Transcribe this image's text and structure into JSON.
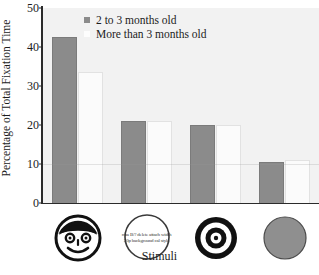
{
  "chart_data": {
    "type": "bar",
    "title": "",
    "xlabel": "Stimuli",
    "ylabel": "Percentage of Total Fixation Time",
    "categories": [
      "face",
      "scrambled-face",
      "bullseye",
      "blank-gray-disk"
    ],
    "ylim": [
      0,
      50
    ],
    "yticks": [
      0,
      10,
      20,
      30,
      40,
      50
    ],
    "ytick_labels": [
      "0",
      "10",
      "20",
      "30",
      "40",
      "50"
    ],
    "grid": false,
    "legend_position": "top-center",
    "series": [
      {
        "name": "2 to 3 months old",
        "color": "#8b8b8b",
        "values": [
          42.5,
          21.0,
          20.0,
          10.5
        ]
      },
      {
        "name": "More than 3 months old",
        "color": "#fbfbfb",
        "values": [
          33.5,
          21.0,
          20.0,
          11.0
        ]
      }
    ]
  },
  "axes": {
    "ylabel": "Percentage of Total Fixation Time",
    "xlabel": "Stimuli",
    "ytick_labels": [
      "50",
      "40",
      "30",
      "20",
      "10",
      "0"
    ]
  },
  "legend": {
    "entries": [
      {
        "label": "2 to 3 months old",
        "swatch": "filled-gray-square"
      },
      {
        "label": "More than 3 months old",
        "swatch": "filled-white-square"
      }
    ]
  },
  "stimuli": [
    {
      "name": "face",
      "icon": "smiley-face-icon",
      "text": ""
    },
    {
      "name": "scrambled-face",
      "icon": "scrambled-text-circle-icon",
      "text": "rma B/? delete attach width 30p background cal style"
    },
    {
      "name": "bullseye",
      "icon": "bullseye-icon",
      "text": ""
    },
    {
      "name": "blank-gray-disk",
      "icon": "gray-disk-icon",
      "text": ""
    }
  ]
}
